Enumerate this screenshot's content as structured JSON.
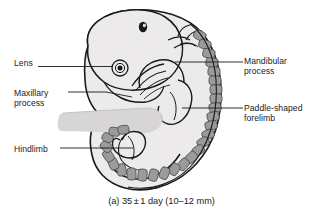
{
  "figure": {
    "caption": "(a) 35 ± 1 day (10–12 mm)",
    "caption_parts": {
      "panel": "(a)",
      "age_value": "35",
      "plus_minus": "±",
      "tolerance": "1",
      "age_unit": "day",
      "size_range": "(10–12 mm)"
    },
    "background_color": "#ffffff",
    "outline_color": "#1a1a1a",
    "body_fill_color": "#eceaea",
    "somite_fill_color": "#9b9b9b",
    "leader_line_color": "#1a1a1a"
  },
  "labels": {
    "lens": {
      "text": "Lens",
      "side": "left",
      "lines": [
        "Lens"
      ]
    },
    "maxillary_process": {
      "text": "Maxillary process",
      "side": "left",
      "lines": [
        "Maxillary",
        "process"
      ]
    },
    "hindlimb": {
      "text": "Hindlimb",
      "side": "left",
      "lines": [
        "Hindlimb"
      ]
    },
    "mandibular_process": {
      "text": "Mandibular process",
      "side": "right",
      "lines": [
        "Mandibular",
        "process"
      ]
    },
    "paddle_shaped_forelimb": {
      "text": "Paddle-shaped forelimb",
      "side": "right",
      "lines": [
        "Paddle-shaped",
        "forelimb"
      ]
    }
  },
  "anatomy": {
    "otic_vesicle": "otic-vesicle",
    "lens_eye": "eye-lens",
    "somites": "somite-blocks",
    "tail": "curled-tail",
    "umbilical_stalk": "umbilical-stalk",
    "forelimb_bud": "forelimb-bud",
    "hindlimb_bud": "hindlimb-bud",
    "branchial_arches": "branchial-arches"
  }
}
